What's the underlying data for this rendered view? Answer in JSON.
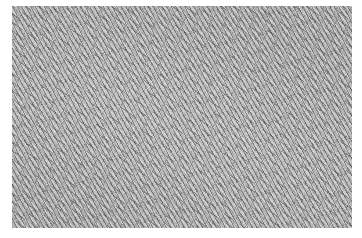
{
  "image": {
    "description": "Grayscale histology micrograph showing densely packed spindle-shaped cells in fascicles",
    "colors": {
      "background": "#ffffff",
      "tissue_mid": "#a9a9a9",
      "nuclei_dark": "#282828",
      "stroma_light": "#ebebeb"
    }
  }
}
